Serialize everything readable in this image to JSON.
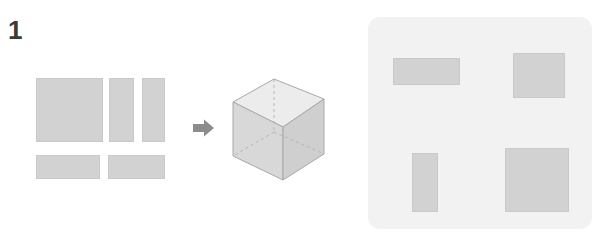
{
  "figure": {
    "step_label": "1",
    "colors": {
      "background": "#ffffff",
      "shape_fill": "#d2d2d2",
      "shape_stroke": "#c9c9c9",
      "panel_background": "#f2f2f2",
      "arrow": "#8c8c8c",
      "label_text": "#3a3a3a",
      "box_top_face": "#ececec",
      "box_left_face": "#d8d8d8",
      "box_front_face": "#cfcfcf",
      "box_outline": "#a8a8a8",
      "box_hidden_edge": "#b6b6b6"
    },
    "parts_group": {
      "name": "flat-faces",
      "count": 5,
      "rects": [
        {
          "name": "large-square-face",
          "x": 36,
          "y": 78,
          "w": 67,
          "h": 64
        },
        {
          "name": "tall-face-left",
          "x": 109,
          "y": 78,
          "w": 25,
          "h": 64
        },
        {
          "name": "tall-face-right",
          "x": 142,
          "y": 78,
          "w": 23,
          "h": 64
        },
        {
          "name": "wide-face-left",
          "x": 36,
          "y": 155,
          "w": 64,
          "h": 24
        },
        {
          "name": "wide-face-right",
          "x": 108,
          "y": 155,
          "w": 57,
          "h": 24
        }
      ]
    },
    "arrow": {
      "name": "right-arrow-icon",
      "direction": "right"
    },
    "assembled_shape": {
      "name": "cuboid-3d",
      "type": "rectangular-box",
      "projection": "isometric",
      "hidden_edges": "dashed"
    },
    "result_panel": {
      "name": "result-panel",
      "count": 4,
      "rects": [
        {
          "name": "panel-rect-top-left",
          "x": 25,
          "y": 41,
          "w": 67,
          "h": 27
        },
        {
          "name": "panel-rect-top-right",
          "x": 145,
          "y": 36,
          "w": 52,
          "h": 45
        },
        {
          "name": "panel-rect-bottom-left",
          "x": 44,
          "y": 136,
          "w": 26,
          "h": 59
        },
        {
          "name": "panel-rect-bottom-right",
          "x": 137,
          "y": 131,
          "w": 64,
          "h": 64
        }
      ]
    }
  }
}
